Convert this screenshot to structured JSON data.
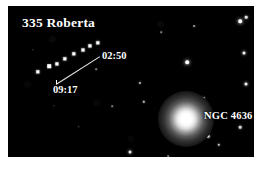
{
  "figure": {
    "background_color": "#ffffff",
    "sky_color": "#000000",
    "star_color": "#ffffff",
    "frame": {
      "x": 8,
      "y": 6,
      "width": 246,
      "height": 151
    }
  },
  "labels": {
    "object_title": "335 Roberta",
    "time_upper": "02:50",
    "time_lower": "09:17",
    "galaxy_name": "NGC 4636"
  },
  "caption": {
    "clipped_text": ""
  },
  "leader_line": {
    "x1": 48,
    "y1": 78,
    "x2": 92,
    "y2": 50
  },
  "asteroid_trail": {
    "name": "335 Roberta",
    "start_time": "09:17",
    "end_time": "02:50",
    "dots": [
      {
        "x": 30,
        "y": 66,
        "size": 3.4
      },
      {
        "x": 41,
        "y": 60,
        "size": 3.6
      },
      {
        "x": 49,
        "y": 58,
        "size": 3.2
      },
      {
        "x": 57,
        "y": 53,
        "size": 3.4
      },
      {
        "x": 66,
        "y": 48,
        "size": 3.4
      },
      {
        "x": 75,
        "y": 44,
        "size": 3.0
      },
      {
        "x": 82,
        "y": 40,
        "size": 3.2
      },
      {
        "x": 90,
        "y": 37,
        "size": 3.4
      }
    ]
  },
  "galaxy": {
    "name": "NGC 4636",
    "x": 178,
    "y": 113,
    "halo_diameter": 56,
    "core_color": "#ffffff"
  },
  "stars": [
    {
      "x": 232,
      "y": 15,
      "size": 3.6,
      "brightness": 1.0
    },
    {
      "x": 238,
      "y": 11,
      "size": 2.6,
      "brightness": 0.9
    },
    {
      "x": 236,
      "y": 47,
      "size": 3.0,
      "brightness": 0.95
    },
    {
      "x": 238,
      "y": 78,
      "size": 3.0,
      "brightness": 0.95
    },
    {
      "x": 232,
      "y": 121,
      "size": 2.6,
      "brightness": 0.85
    },
    {
      "x": 211,
      "y": 139,
      "size": 2.4,
      "brightness": 0.8
    },
    {
      "x": 196,
      "y": 92,
      "size": 2.2,
      "brightness": 0.8
    },
    {
      "x": 200,
      "y": 130,
      "size": 2.6,
      "brightness": 0.85
    },
    {
      "x": 179,
      "y": 56,
      "size": 3.6,
      "brightness": 1.0
    },
    {
      "x": 186,
      "y": 20,
      "size": 1.8,
      "brightness": 0.6
    },
    {
      "x": 153,
      "y": 26,
      "size": 1.6,
      "brightness": 0.5
    },
    {
      "x": 136,
      "y": 96,
      "size": 2.4,
      "brightness": 0.8
    },
    {
      "x": 132,
      "y": 77,
      "size": 2.2,
      "brightness": 0.75
    },
    {
      "x": 122,
      "y": 146,
      "size": 3.0,
      "brightness": 0.9
    },
    {
      "x": 104,
      "y": 100,
      "size": 1.6,
      "brightness": 0.5
    },
    {
      "x": 88,
      "y": 63,
      "size": 1.6,
      "brightness": 0.5
    },
    {
      "x": 71,
      "y": 121,
      "size": 1.4,
      "brightness": 0.45
    },
    {
      "x": 46,
      "y": 100,
      "size": 1.4,
      "brightness": 0.4
    },
    {
      "x": 25,
      "y": 44,
      "size": 1.4,
      "brightness": 0.4
    },
    {
      "x": 160,
      "y": 150,
      "size": 1.6,
      "brightness": 0.5
    }
  ]
}
